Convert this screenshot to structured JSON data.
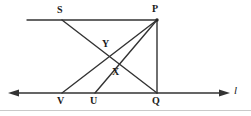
{
  "figure": {
    "stroke_color": "#262626",
    "label_color": "#1a1a1a",
    "background": "#ffffff",
    "points": {
      "S": {
        "label": "S",
        "x": 62,
        "y": 20,
        "label_x": 57,
        "label_y": 6
      },
      "P": {
        "label": "P",
        "x": 157,
        "y": 20,
        "label_x": 153,
        "label_y": 5
      },
      "Y": {
        "label": "Y",
        "x": 109,
        "y": 51,
        "label_x": 103,
        "label_y": 39
      },
      "X": {
        "label": "X",
        "x": 119,
        "y": 66,
        "label_x": 113,
        "label_y": 67
      },
      "V": {
        "label": "V",
        "x": 62,
        "y": 93,
        "label_x": 57,
        "label_y": 96
      },
      "U": {
        "label": "U",
        "x": 95,
        "y": 93,
        "label_x": 90,
        "label_y": 96
      },
      "Q": {
        "label": "Q",
        "x": 157,
        "y": 93,
        "label_x": 152,
        "label_y": 96
      }
    },
    "line_l": {
      "label": "l",
      "label_x": 234,
      "label_y": 85,
      "y": 93,
      "x_start": 10,
      "x_end": 228,
      "arrow_left": true,
      "arrow_right": true
    },
    "segments": [
      {
        "name": "ray-SP-horizontal",
        "from": "start",
        "x1": 27,
        "y1": 20,
        "x2": 157,
        "y2": 20
      },
      {
        "name": "segment-PQ-vertical",
        "x1": 157,
        "y1": 20,
        "x2": 157,
        "y2": 93
      },
      {
        "name": "segment-S-to-Q",
        "x1": 62,
        "y1": 20,
        "x2": 157,
        "y2": 93
      },
      {
        "name": "segment-V-to-P",
        "x1": 62,
        "y1": 93,
        "x2": 157,
        "y2": 20
      },
      {
        "name": "segment-U-to-P",
        "x1": 95,
        "y1": 93,
        "x2": 157,
        "y2": 20
      }
    ]
  }
}
